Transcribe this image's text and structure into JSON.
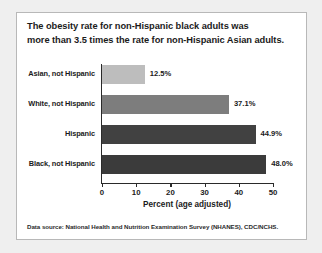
{
  "card": {
    "title_line1": "The obesity rate for non-Hispanic black adults was",
    "title_line2": "more than 3.5 times the rate for non-Hispanic Asian adults.",
    "source": "Data source: National Health and Nutrition Examination Survey (NHANES), CDC/NCHS."
  },
  "chart_data": {
    "type": "bar",
    "orientation": "horizontal",
    "title": "The obesity rate for non-Hispanic black adults was more than 3.5 times the rate for non-Hispanic Asian adults.",
    "categories": [
      "Asian, not Hispanic",
      "White, not Hispanic",
      "Hispanic",
      "Black, not Hispanic"
    ],
    "values": [
      12.5,
      37.1,
      44.9,
      48.0
    ],
    "value_labels": [
      "12.5%",
      "37.1%",
      "44.9%",
      "48.0%"
    ],
    "bar_colors": [
      "#bdbdbd",
      "#7d7d7d",
      "#414141",
      "#3b3b3b"
    ],
    "xlabel": "Percent (age adjusted)",
    "ylabel": "",
    "xlim": [
      0,
      50
    ],
    "xticks": [
      0,
      10,
      20,
      30,
      40,
      50
    ],
    "xtick_labels": [
      "0",
      "10",
      "20",
      "30",
      "40",
      "50"
    ],
    "grid": false,
    "legend": false,
    "source": "Data source: National Health and Nutrition Examination Survey (NHANES), CDC/NCHS."
  }
}
